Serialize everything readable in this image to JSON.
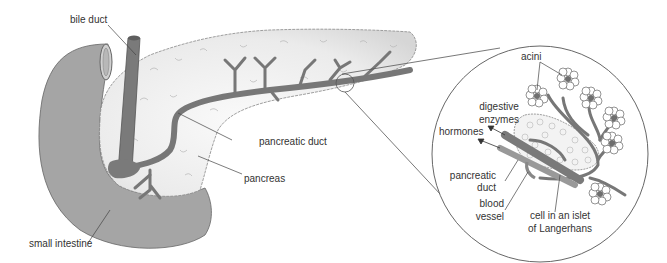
{
  "diagram": {
    "labels": {
      "bile_duct": "bile duct",
      "pancreatic_duct": "pancreatic duct",
      "pancreas": "pancreas",
      "small_intestine": "small intestine",
      "acini": "acini",
      "digestive_enzymes_1": "digestive",
      "digestive_enzymes_2": "enzymes",
      "hormones": "hormones",
      "pancreatic_duct_inset_1": "pancreatic",
      "pancreatic_duct_inset_2": "duct",
      "blood_vessel_1": "blood",
      "blood_vessel_2": "vessel",
      "islet_1": "cell in an islet",
      "islet_2": "of Langerhans"
    },
    "colors": {
      "intestine": "#a3a3a3",
      "duct": "#7a7a7a",
      "pancreas_fill": "#ececec",
      "outline": "#555555",
      "text": "#333333",
      "leader": "#444444"
    }
  }
}
